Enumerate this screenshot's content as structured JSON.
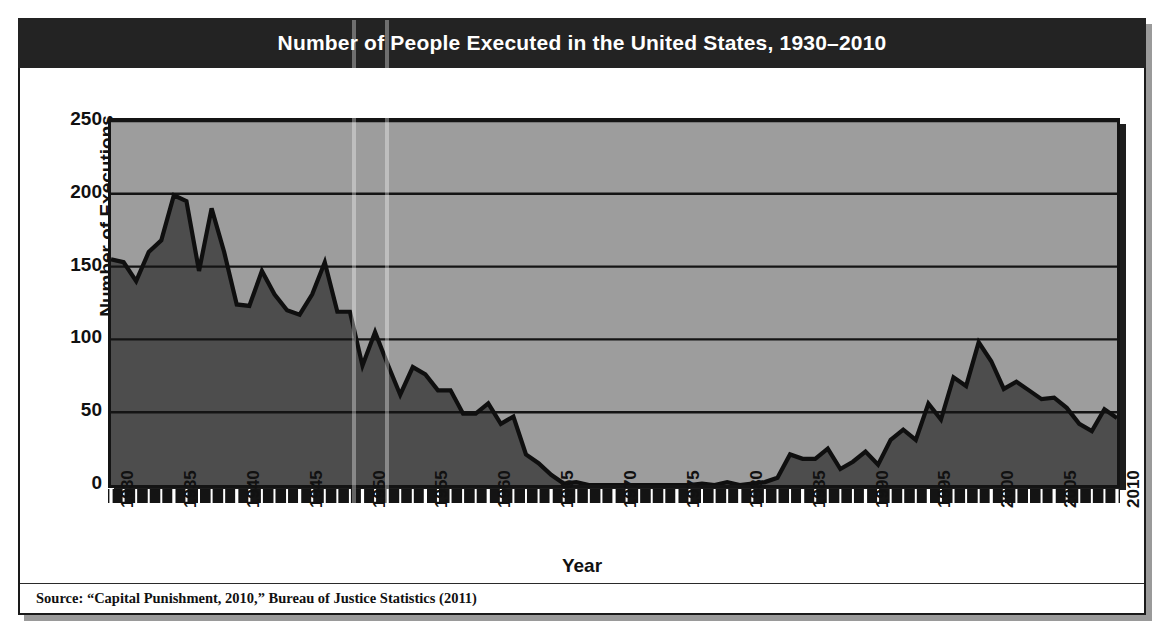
{
  "figure": {
    "title": "Number of People Executed in the United States, 1930–2010",
    "source": "Source: “Capital Punishment, 2010,” Bureau of Justice Statistics (2011)",
    "colors": {
      "title_bar": "#232323",
      "plot_background": "#9d9d9d",
      "area_fill": "#4d4d4d",
      "line": "#0f0f0f",
      "frame": "#1a1a1a",
      "text": "#111111"
    }
  },
  "chart_data": {
    "type": "area",
    "title": "Number of People Executed in the United States, 1930–2010",
    "xlabel": "Year",
    "ylabel": "Number of Executions",
    "xlim": [
      1930,
      2010
    ],
    "ylim": [
      0,
      250
    ],
    "yticks": [
      0,
      50,
      100,
      150,
      200,
      250
    ],
    "ytick_labels": [
      "0",
      "50",
      "100",
      "150",
      "200",
      "250"
    ],
    "xticks": [
      1930,
      1935,
      1940,
      1945,
      1950,
      1955,
      1960,
      1965,
      1970,
      1975,
      1980,
      1985,
      1990,
      1995,
      2000,
      2005,
      2010
    ],
    "xtick_labels": [
      "1930",
      "1935",
      "1940",
      "1945",
      "1950",
      "1955",
      "1960",
      "1965",
      "1970",
      "1975",
      "1980",
      "1985",
      "1990",
      "1995",
      "2000",
      "2005",
      "2010"
    ],
    "minor_xtick_interval": 1,
    "grid": "horizontal",
    "legend": "none",
    "x": [
      1930,
      1931,
      1932,
      1933,
      1934,
      1935,
      1936,
      1937,
      1938,
      1939,
      1940,
      1941,
      1942,
      1943,
      1944,
      1945,
      1946,
      1947,
      1948,
      1949,
      1950,
      1951,
      1952,
      1953,
      1954,
      1955,
      1956,
      1957,
      1958,
      1959,
      1960,
      1961,
      1962,
      1963,
      1964,
      1965,
      1966,
      1967,
      1968,
      1969,
      1970,
      1971,
      1972,
      1973,
      1974,
      1975,
      1976,
      1977,
      1978,
      1979,
      1980,
      1981,
      1982,
      1983,
      1984,
      1985,
      1986,
      1987,
      1988,
      1989,
      1990,
      1991,
      1992,
      1993,
      1994,
      1995,
      1996,
      1997,
      1998,
      1999,
      2000,
      2001,
      2002,
      2003,
      2004,
      2005,
      2006,
      2007,
      2008,
      2009,
      2010
    ],
    "y": [
      155,
      153,
      140,
      160,
      168,
      199,
      195,
      147,
      190,
      160,
      124,
      123,
      147,
      131,
      120,
      117,
      131,
      153,
      119,
      119,
      82,
      105,
      83,
      62,
      81,
      76,
      65,
      65,
      49,
      49,
      56,
      42,
      47,
      21,
      15,
      7,
      1,
      2,
      0,
      0,
      0,
      0,
      0,
      0,
      0,
      0,
      0,
      1,
      0,
      2,
      0,
      1,
      2,
      5,
      21,
      18,
      18,
      25,
      11,
      16,
      23,
      14,
      31,
      38,
      31,
      56,
      45,
      74,
      68,
      98,
      85,
      66,
      71,
      65,
      59,
      60,
      53,
      42,
      37,
      52,
      46
    ],
    "series": [
      {
        "name": "Executions",
        "values": [
          155,
          153,
          140,
          160,
          168,
          199,
          195,
          147,
          190,
          160,
          124,
          123,
          147,
          131,
          120,
          117,
          131,
          153,
          119,
          119,
          82,
          105,
          83,
          62,
          81,
          76,
          65,
          65,
          49,
          49,
          56,
          42,
          47,
          21,
          15,
          7,
          1,
          2,
          0,
          0,
          0,
          0,
          0,
          0,
          0,
          0,
          0,
          1,
          0,
          2,
          0,
          1,
          2,
          5,
          21,
          18,
          18,
          25,
          11,
          16,
          23,
          14,
          31,
          38,
          31,
          56,
          45,
          74,
          68,
          98,
          85,
          66,
          71,
          65,
          59,
          60,
          53,
          42,
          37,
          52,
          46
        ]
      }
    ]
  }
}
